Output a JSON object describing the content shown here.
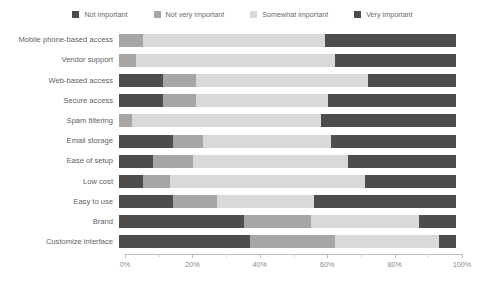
{
  "chart_data": {
    "type": "bar",
    "orientation": "horizontal",
    "stacked": true,
    "stack_mode": "percent",
    "title": "",
    "subtitle": "",
    "xlabel": "",
    "ylabel": "",
    "xlim": [
      0,
      100
    ],
    "xticks": [
      0,
      20,
      40,
      60,
      80,
      100
    ],
    "xtick_labels": [
      "0%",
      "20%",
      "40%",
      "60%",
      "80%",
      "100%"
    ],
    "grid": false,
    "legend_position": "top-center",
    "categories": [
      "Mobile phone-based access",
      "Vendor support",
      "Web-based access",
      "Secure access",
      "Spam filtering",
      "Email storage",
      "Ease of setup",
      "Low cost",
      "Easy to use",
      "Brand",
      "Customize interface"
    ],
    "series": [
      {
        "name": "Not important",
        "color": "#4d4d4d",
        "values": [
          0,
          0,
          13,
          13,
          0,
          16,
          10,
          7,
          16,
          37,
          39
        ]
      },
      {
        "name": "Not very important",
        "color": "#a6a6a6",
        "values": [
          7,
          5,
          10,
          10,
          4,
          9,
          12,
          8,
          13,
          20,
          25
        ]
      },
      {
        "name": "Somewhat important",
        "color": "#d9d9d9",
        "values": [
          54,
          59,
          51,
          39,
          56,
          38,
          46,
          58,
          29,
          32,
          31
        ]
      },
      {
        "name": "Very important",
        "color": "#4d4d4d",
        "values": [
          39,
          36,
          26,
          38,
          40,
          37,
          32,
          27,
          42,
          11,
          5
        ]
      }
    ]
  },
  "legend": {
    "items": [
      {
        "label": "Not important",
        "color": "#4d4d4d"
      },
      {
        "label": "Not very important",
        "color": "#a6a6a6"
      },
      {
        "label": "Somewhat important",
        "color": "#d9d9d9"
      },
      {
        "label": "Very important",
        "color": "#4d4d4d"
      }
    ]
  }
}
